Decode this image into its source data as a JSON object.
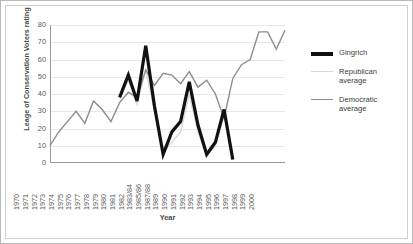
{
  "chart_data": {
    "type": "line",
    "title": "",
    "xlabel": "Year",
    "ylabel": "Leage of Conservation Voters rating",
    "ylim": [
      0,
      80
    ],
    "ytick_step": 10,
    "yticks": [
      80,
      70,
      60,
      50,
      40,
      30,
      20,
      10,
      0
    ],
    "grid": true,
    "legend_position": "right",
    "categories": [
      "1970",
      "1971",
      "1972",
      "1973",
      "1974",
      "1975",
      "1976",
      "1977",
      "1978",
      "1979",
      "1980",
      "1981",
      "1982",
      "1983/84",
      "1985/86",
      "1987/88",
      "1989",
      "1990",
      "1991",
      "1992",
      "1993",
      "1994",
      "1995",
      "1996",
      "1997",
      "1998",
      "1999",
      "2000"
    ],
    "series": [
      {
        "name": "Gingrich",
        "color": "#111111",
        "width": 3.2,
        "values": [
          null,
          null,
          null,
          null,
          null,
          null,
          null,
          null,
          38,
          51,
          36,
          68,
          33,
          5,
          18,
          24,
          47,
          22,
          5,
          12,
          31,
          2,
          null,
          null,
          null,
          null,
          null,
          null
        ]
      },
      {
        "name": "Republican average",
        "color": "#d9d9d9",
        "width": 1.4,
        "values": [
          null,
          null,
          null,
          null,
          null,
          null,
          null,
          null,
          37,
          48,
          34,
          54,
          30,
          6,
          12,
          18,
          40,
          18,
          4,
          10,
          27,
          2,
          null,
          null,
          null,
          null,
          null,
          null
        ]
      },
      {
        "name": "Democratic average",
        "color": "#8d8d8d",
        "width": 1.4,
        "values": [
          10,
          18,
          24,
          30,
          23,
          36,
          31,
          24,
          35,
          41,
          38,
          54,
          45,
          52,
          51,
          46,
          53,
          44,
          48,
          40,
          26,
          49,
          57,
          60,
          76,
          76,
          66,
          77
        ]
      }
    ]
  },
  "legend": {
    "items": [
      {
        "label": "Gingrich"
      },
      {
        "label": "Republican average"
      },
      {
        "label": "Democratic average"
      }
    ]
  }
}
